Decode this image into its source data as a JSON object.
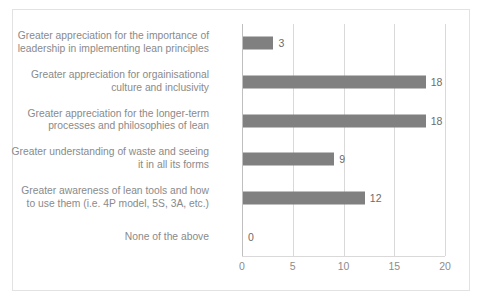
{
  "chart_data": {
    "type": "bar",
    "orientation": "horizontal",
    "title": "",
    "xlabel": "",
    "ylabel": "",
    "xlim": [
      0,
      20
    ],
    "xticks": [
      0,
      5,
      10,
      15,
      20
    ],
    "xtick_labels": [
      "0",
      "5",
      "10",
      "15",
      "20"
    ],
    "grid": true,
    "legend": false,
    "bar_color": "#808080",
    "categories": [
      "Greater appreciation for the importance of\nleadership in implementing lean principles",
      "Greater appreciation for orgainisational\nculture and inclusivity",
      "Greater appreciation for the longer-term\nprocesses and philosophies of lean",
      "Greater understanding of waste and seeing\nit in all its forms",
      "Greater awareness of lean tools and how\nto use them (i.e. 4P model, 5S, 3A, etc.)",
      "None of the above"
    ],
    "values": [
      3,
      18,
      18,
      9,
      12,
      0
    ],
    "data_labels": [
      "3",
      "18",
      "18",
      "9",
      "12",
      "0"
    ]
  }
}
